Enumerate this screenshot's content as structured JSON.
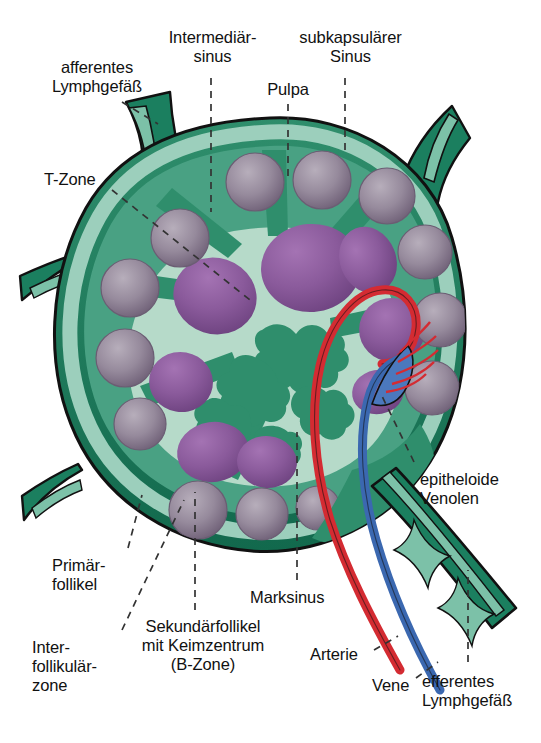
{
  "figure": {
    "background_color": "#ffffff",
    "palette": {
      "capsule_dark_green": "#1b7f5f",
      "cortex_green": "#3f9c7c",
      "paracortex_mid_green": "#57ab8c",
      "subcapsular_sinus_light": "#9ccfbc",
      "medulla_pale": "#b6dac9",
      "primary_follicle_grey_purple": "#8d7f93",
      "secondary_follicle_purple": "#8b5a9b",
      "germinal_center_purple": "#7c4e8e",
      "artery_red": "#d42b32",
      "vein_blue": "#3b68b0",
      "outline_black": "#111111",
      "label_text": "#111111",
      "leader_line": "#333333"
    }
  },
  "labels": {
    "afferentes_lymphgefaess": "afferentes\nLymphgefäß",
    "intermediaersinus": "Intermediär-\nsinus",
    "subkapsulaerer_sinus": "subkapsulärer\nSinus",
    "pulpa": "Pulpa",
    "t_zone": "T-Zone",
    "epitheloide_venolen": "epitheloide\nVenolen",
    "primaerfollikel": "Primär-\nfollikel",
    "interfollikulaerzone": "Inter-\nfollikulär-\nzone",
    "sekundaerfollikel": "Sekundärfollikel\nmit Keimzentrum\n(B-Zone)",
    "marksinus": "Marksinus",
    "arterie": "Arterie",
    "vene": "Vene",
    "efferentes_lymphgefaess": "efferentes\nLymphgefäß"
  },
  "structures": [
    {
      "name": "afferent-lymph-vessel-top-left",
      "label_key": "afferentes_lymphgefaess",
      "kind": "vessel"
    },
    {
      "name": "afferent-lymph-vessel-top-right",
      "label_key": "afferentes_lymphgefaess",
      "kind": "vessel"
    },
    {
      "name": "afferent-lymph-vessel-left-upper",
      "label_key": "afferentes_lymphgefaess",
      "kind": "vessel"
    },
    {
      "name": "afferent-lymph-vessel-left-lower",
      "label_key": "afferentes_lymphgefaess",
      "kind": "vessel"
    },
    {
      "name": "intermediate-sinus",
      "label_key": "intermediaersinus",
      "kind": "sinus"
    },
    {
      "name": "subcapsular-sinus",
      "label_key": "subkapsulaerer_sinus",
      "kind": "sinus"
    },
    {
      "name": "pulp",
      "label_key": "pulpa",
      "kind": "tissue"
    },
    {
      "name": "t-zone",
      "label_key": "t_zone",
      "kind": "tissue"
    },
    {
      "name": "high-endothelial-venules",
      "label_key": "epitheloide_venolen",
      "kind": "vessel"
    },
    {
      "name": "primary-follicle",
      "label_key": "primaerfollikel",
      "kind": "follicle",
      "count": 14
    },
    {
      "name": "interfollicular-zone",
      "label_key": "interfollikulaerzone",
      "kind": "tissue"
    },
    {
      "name": "secondary-follicle-with-germinal-center",
      "label_key": "sekundaerfollikel",
      "kind": "follicle",
      "count": 8
    },
    {
      "name": "medullary-sinus",
      "label_key": "marksinus",
      "kind": "sinus"
    },
    {
      "name": "artery",
      "label_key": "arterie",
      "kind": "vessel",
      "color": "#d42b32"
    },
    {
      "name": "vein",
      "label_key": "vene",
      "kind": "vessel",
      "color": "#3b68b0"
    },
    {
      "name": "efferent-lymph-vessel",
      "label_key": "efferentes_lymphgefaess",
      "kind": "vessel"
    }
  ]
}
